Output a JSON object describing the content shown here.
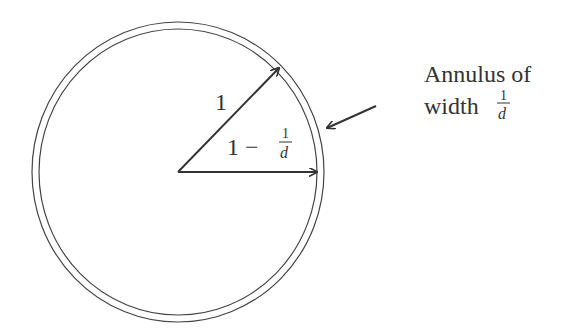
{
  "diagram": {
    "outer_radius_label": "1",
    "inner_radius_label_main": "1 −",
    "inner_radius_frac_num": "1",
    "inner_radius_frac_den": "d",
    "annotation_line1": "Annulus of",
    "annotation_line2": "width",
    "annotation_frac_num": "1",
    "annotation_frac_den": "d"
  },
  "colors": {
    "stroke": "#333333",
    "background": "#ffffff"
  }
}
